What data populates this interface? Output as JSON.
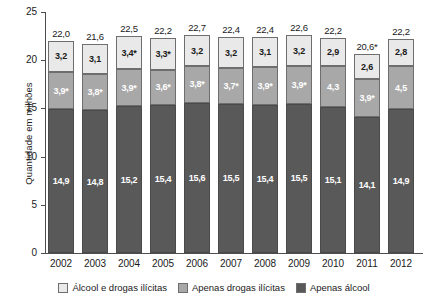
{
  "chart_data": {
    "type": "bar",
    "stacked": true,
    "title": "",
    "xlabel": "",
    "ylabel": "Quantidade em milhões",
    "ylim": [
      0,
      25
    ],
    "yticks": [
      "0",
      "5",
      "10",
      "15",
      "20",
      "25"
    ],
    "grid": false,
    "legend_position": "bottom",
    "categories": [
      "2002",
      "2003",
      "2004",
      "2005",
      "2006",
      "2007",
      "2008",
      "2009",
      "2010",
      "2011",
      "2012"
    ],
    "series": [
      {
        "name": "Apenas álcool",
        "color": "#595959",
        "values": [
          14.9,
          14.8,
          15.2,
          15.4,
          15.6,
          15.5,
          15.4,
          15.5,
          15.1,
          14.1,
          14.9
        ],
        "labels": [
          "14,9",
          "14,8",
          "15,2",
          "15,4",
          "15,6",
          "15,5",
          "15,4",
          "15,5",
          "15,1",
          "14,1",
          "14,9"
        ]
      },
      {
        "name": "Apenas drogas ilícitas",
        "color": "#a8a8a8",
        "values": [
          3.9,
          3.8,
          3.9,
          3.6,
          3.8,
          3.7,
          3.9,
          3.9,
          4.3,
          3.9,
          4.5
        ],
        "labels": [
          "3,9*",
          "3,8*",
          "3,9*",
          "3,6*",
          "3,8*",
          "3,7*",
          "3,9*",
          "3,9*",
          "4,3",
          "3,9*",
          "4,5"
        ]
      },
      {
        "name": "Álcool e drogas ilícitas",
        "color": "#e9e9e9",
        "values": [
          3.2,
          3.1,
          3.4,
          3.3,
          3.2,
          3.2,
          3.1,
          3.2,
          2.9,
          2.6,
          2.8
        ],
        "labels": [
          "3,2",
          "3,1",
          "3,4*",
          "3,3*",
          "3,2",
          "3,2",
          "3,1",
          "3,2",
          "2,9",
          "2,6",
          "2,8"
        ]
      }
    ],
    "totals": [
      22.0,
      21.6,
      22.5,
      22.2,
      22.7,
      22.4,
      22.4,
      22.6,
      22.2,
      20.6,
      22.2
    ],
    "total_labels": [
      "22,0",
      "21,6",
      "22,5",
      "22,2",
      "22,7",
      "22,4",
      "22,4",
      "22,6",
      "22,2",
      "20,6*",
      "22,2"
    ],
    "legend": [
      {
        "label": "Álcool e drogas ilícitas",
        "color": "#e9e9e9"
      },
      {
        "label": "Apenas drogas ilícitas",
        "color": "#a8a8a8"
      },
      {
        "label": "Apenas álcool",
        "color": "#595959"
      }
    ]
  }
}
